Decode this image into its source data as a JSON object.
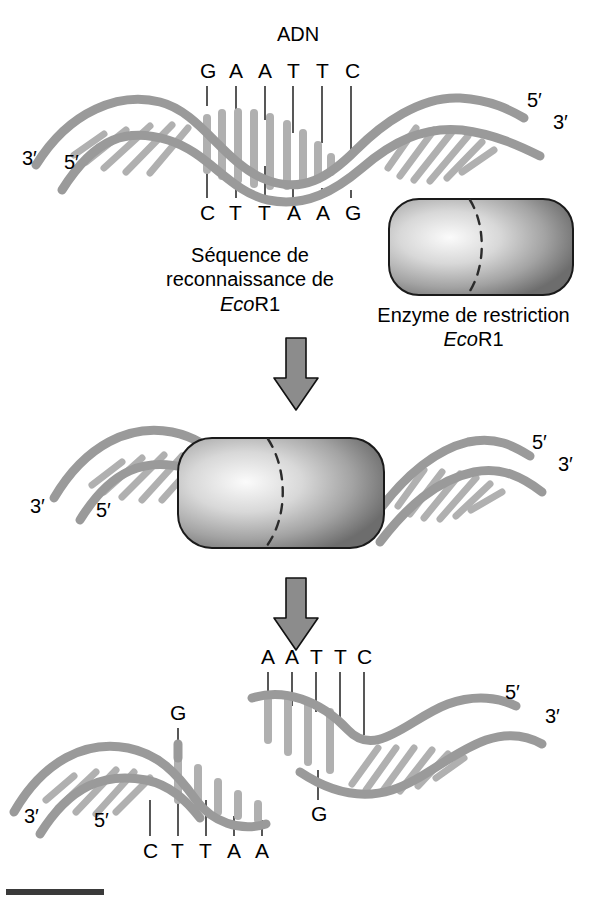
{
  "figure": {
    "title": "ADN",
    "language": "fr"
  },
  "colors": {
    "strand_fill": "#9a9a9a",
    "strand_stroke": "#1a1a1a",
    "rung_fill": "#b5b5b5",
    "enzyme_light": "#f2f2f2",
    "enzyme_mid": "#a8a8a8",
    "enzyme_dark": "#6e6e6e",
    "arrow_fill": "#8c8c8c",
    "arrow_stroke": "#111111",
    "text": "#000000",
    "rule_bar": "#3a3a3a"
  },
  "panels": {
    "top": {
      "label_dna": "ADN",
      "top_sequence": [
        "G",
        "A",
        "A",
        "T",
        "T",
        "C"
      ],
      "bottom_sequence": [
        "C",
        "T",
        "T",
        "A",
        "A",
        "G"
      ],
      "left_labels": [
        "3′",
        "5′"
      ],
      "right_labels": [
        "5′",
        "3′"
      ],
      "caption_line1": "Séquence de",
      "caption_line2": "reconnaissance de",
      "caption_enzyme_italic": "Eco",
      "caption_enzyme_rest": "R1",
      "enzyme_caption_line1": "Enzyme de restriction",
      "enzyme_caption_italic": "Eco",
      "enzyme_caption_rest": "R1"
    },
    "middle": {
      "left_labels": [
        "3′",
        "5′"
      ],
      "right_labels": [
        "5′",
        "3′"
      ]
    },
    "bottom": {
      "right_fragment": {
        "sequence": [
          "A",
          "A",
          "T",
          "T",
          "C"
        ],
        "overhang_base": "G",
        "right_labels": [
          "5′",
          "3′"
        ]
      },
      "left_fragment": {
        "sequence": [
          "C",
          "T",
          "T",
          "A",
          "A"
        ],
        "overhang_base": "G",
        "left_labels": [
          "3′",
          "5′"
        ]
      }
    }
  },
  "arrows": [
    {
      "name": "arrow-step-1"
    },
    {
      "name": "arrow-step-2"
    }
  ]
}
